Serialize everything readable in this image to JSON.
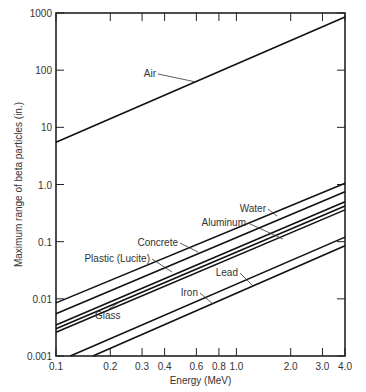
{
  "chart_data": {
    "type": "line",
    "title": "",
    "xlabel": "Energy (MeV)",
    "ylabel": "Maximum range of beta particles (in.)",
    "xscale": "log",
    "yscale": "log",
    "xlim": [
      0.1,
      4.0
    ],
    "ylim": [
      0.001,
      1000
    ],
    "xticks": [
      0.1,
      0.2,
      0.3,
      0.4,
      0.6,
      0.8,
      1.0,
      2.0,
      3.0,
      4.0
    ],
    "xtick_labels": [
      "0.1",
      "0.2",
      "0.3",
      "0.4",
      "0.6",
      "0.8",
      "1.0",
      "2.0",
      "3.0",
      "4.0"
    ],
    "yticks": [
      0.001,
      0.01,
      0.1,
      1.0,
      10,
      100,
      1000
    ],
    "ytick_labels": [
      "0.001",
      "0.01",
      "0.1",
      "1.0",
      "10",
      "100",
      "1000"
    ],
    "grid": false,
    "legend": "inline labels",
    "series": [
      {
        "name": "Air",
        "x": [
          0.1,
          4.0
        ],
        "values": [
          5.5,
          850
        ]
      },
      {
        "name": "Water",
        "x": [
          0.1,
          4.0
        ],
        "values": [
          0.0085,
          1.05
        ]
      },
      {
        "name": "Plastic (Lucite)",
        "x": [
          0.1,
          4.0
        ],
        "values": [
          0.0055,
          0.75
        ]
      },
      {
        "name": "Aluminum",
        "x": [
          0.1,
          4.0
        ],
        "values": [
          0.0035,
          0.5
        ]
      },
      {
        "name": "Concrete",
        "x": [
          0.1,
          4.0
        ],
        "values": [
          0.003,
          0.42
        ]
      },
      {
        "name": "Glass",
        "x": [
          0.1,
          4.0
        ],
        "values": [
          0.0026,
          0.36
        ]
      },
      {
        "name": "Lead",
        "x": [
          0.12,
          4.0
        ],
        "values": [
          0.001,
          0.12
        ]
      },
      {
        "name": "Iron",
        "x": [
          0.16,
          4.0
        ],
        "values": [
          0.001,
          0.085
        ]
      }
    ]
  }
}
